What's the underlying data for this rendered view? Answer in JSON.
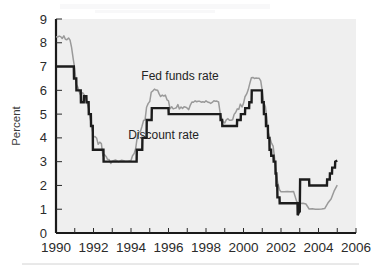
{
  "figure": {
    "background_color": "#ffffff",
    "plot_background_color": "#efefef",
    "axis_color": "#1a1a1a"
  },
  "axes": {
    "ylabel": "Percent",
    "ytick_labels": [
      "0",
      "1",
      "2",
      "3",
      "4",
      "5",
      "6",
      "7",
      "8",
      "9"
    ],
    "xtick_labels": [
      "1990",
      "1992",
      "1994",
      "1996",
      "1998",
      "2000",
      "2002",
      "2004",
      "2006"
    ]
  },
  "annotations": [
    {
      "name": "fed-funds-rate-label",
      "text": "Fed funds rate",
      "x": 1994.55,
      "y": 6.45
    },
    {
      "name": "discount-rate-label",
      "text": "Discount rate",
      "x": 1993.85,
      "y": 3.95
    }
  ],
  "chart_data": {
    "type": "line",
    "title": "",
    "subtitle": "",
    "xlabel": "",
    "ylabel": "Percent",
    "xlim": [
      1990,
      2006
    ],
    "ylim": [
      0,
      9
    ],
    "grid": false,
    "legend": "inline-annotations",
    "xticks_major": [
      1990,
      1992,
      1994,
      1996,
      1998,
      2000,
      2002,
      2004,
      2006
    ],
    "xticks_minor": [
      1991,
      1993,
      1995,
      1997,
      1999,
      2001,
      2003,
      2005
    ],
    "yticks": [
      0,
      1,
      2,
      3,
      4,
      5,
      6,
      7,
      8,
      9
    ],
    "series": [
      {
        "name": "Fed funds rate",
        "color": "#9a9a9a",
        "linewidth": 1.5,
        "points": [
          [
            1990.0,
            8.25
          ],
          [
            1990.08,
            8.24
          ],
          [
            1990.17,
            8.28
          ],
          [
            1990.25,
            8.26
          ],
          [
            1990.33,
            8.18
          ],
          [
            1990.42,
            8.29
          ],
          [
            1990.5,
            8.15
          ],
          [
            1990.58,
            8.13
          ],
          [
            1990.67,
            8.2
          ],
          [
            1990.75,
            8.11
          ],
          [
            1990.83,
            7.81
          ],
          [
            1990.92,
            7.31
          ],
          [
            1991.0,
            6.91
          ],
          [
            1991.08,
            6.25
          ],
          [
            1991.17,
            6.12
          ],
          [
            1991.25,
            5.91
          ],
          [
            1991.33,
            5.78
          ],
          [
            1991.42,
            5.9
          ],
          [
            1991.5,
            5.82
          ],
          [
            1991.58,
            5.66
          ],
          [
            1991.67,
            5.45
          ],
          [
            1991.75,
            5.21
          ],
          [
            1991.83,
            4.81
          ],
          [
            1991.92,
            4.43
          ],
          [
            1992.0,
            4.03
          ],
          [
            1992.08,
            4.06
          ],
          [
            1992.17,
            3.98
          ],
          [
            1992.25,
            3.73
          ],
          [
            1992.33,
            3.82
          ],
          [
            1992.42,
            3.76
          ],
          [
            1992.5,
            3.25
          ],
          [
            1992.58,
            3.3
          ],
          [
            1992.67,
            3.22
          ],
          [
            1992.75,
            3.1
          ],
          [
            1992.83,
            3.09
          ],
          [
            1992.92,
            2.92
          ],
          [
            1993.0,
            3.02
          ],
          [
            1993.17,
            3.07
          ],
          [
            1993.33,
            3.0
          ],
          [
            1993.5,
            3.06
          ],
          [
            1993.67,
            3.03
          ],
          [
            1993.83,
            3.02
          ],
          [
            1994.0,
            3.05
          ],
          [
            1994.08,
            3.25
          ],
          [
            1994.17,
            3.34
          ],
          [
            1994.25,
            3.56
          ],
          [
            1994.33,
            4.01
          ],
          [
            1994.42,
            4.25
          ],
          [
            1994.5,
            4.26
          ],
          [
            1994.58,
            4.47
          ],
          [
            1994.67,
            4.73
          ],
          [
            1994.75,
            4.76
          ],
          [
            1994.83,
            5.29
          ],
          [
            1994.92,
            5.45
          ],
          [
            1995.0,
            5.53
          ],
          [
            1995.08,
            5.92
          ],
          [
            1995.17,
            5.98
          ],
          [
            1995.25,
            6.05
          ],
          [
            1995.33,
            6.01
          ],
          [
            1995.42,
            6.0
          ],
          [
            1995.5,
            5.85
          ],
          [
            1995.58,
            5.74
          ],
          [
            1995.67,
            5.8
          ],
          [
            1995.75,
            5.76
          ],
          [
            1995.83,
            5.8
          ],
          [
            1995.92,
            5.6
          ],
          [
            1996.0,
            5.56
          ],
          [
            1996.08,
            5.22
          ],
          [
            1996.17,
            5.31
          ],
          [
            1996.25,
            5.22
          ],
          [
            1996.33,
            5.24
          ],
          [
            1996.42,
            5.27
          ],
          [
            1996.5,
            5.4
          ],
          [
            1996.58,
            5.22
          ],
          [
            1996.67,
            5.3
          ],
          [
            1996.75,
            5.24
          ],
          [
            1996.83,
            5.31
          ],
          [
            1996.92,
            5.29
          ],
          [
            1997.0,
            5.25
          ],
          [
            1997.08,
            5.19
          ],
          [
            1997.17,
            5.39
          ],
          [
            1997.25,
            5.51
          ],
          [
            1997.33,
            5.5
          ],
          [
            1997.42,
            5.56
          ],
          [
            1997.5,
            5.52
          ],
          [
            1997.58,
            5.54
          ],
          [
            1997.67,
            5.54
          ],
          [
            1997.75,
            5.5
          ],
          [
            1997.83,
            5.52
          ],
          [
            1997.92,
            5.5
          ],
          [
            1998.0,
            5.56
          ],
          [
            1998.08,
            5.51
          ],
          [
            1998.17,
            5.49
          ],
          [
            1998.25,
            5.45
          ],
          [
            1998.33,
            5.49
          ],
          [
            1998.42,
            5.56
          ],
          [
            1998.5,
            5.54
          ],
          [
            1998.58,
            5.55
          ],
          [
            1998.67,
            5.51
          ],
          [
            1998.75,
            5.07
          ],
          [
            1998.83,
            4.83
          ],
          [
            1998.92,
            4.68
          ],
          [
            1999.0,
            4.63
          ],
          [
            1999.08,
            4.76
          ],
          [
            1999.17,
            4.81
          ],
          [
            1999.25,
            4.74
          ],
          [
            1999.33,
            4.74
          ],
          [
            1999.42,
            4.76
          ],
          [
            1999.5,
            4.99
          ],
          [
            1999.58,
            5.07
          ],
          [
            1999.67,
            5.22
          ],
          [
            1999.75,
            5.2
          ],
          [
            1999.83,
            5.42
          ],
          [
            1999.92,
            5.3
          ],
          [
            2000.0,
            5.45
          ],
          [
            2000.08,
            5.73
          ],
          [
            2000.17,
            5.85
          ],
          [
            2000.25,
            6.02
          ],
          [
            2000.33,
            6.27
          ],
          [
            2000.42,
            6.53
          ],
          [
            2000.5,
            6.54
          ],
          [
            2000.58,
            6.5
          ],
          [
            2000.67,
            6.52
          ],
          [
            2000.75,
            6.51
          ],
          [
            2000.83,
            6.51
          ],
          [
            2000.92,
            6.4
          ],
          [
            2001.0,
            5.98
          ],
          [
            2001.08,
            5.49
          ],
          [
            2001.17,
            5.31
          ],
          [
            2001.25,
            4.8
          ],
          [
            2001.33,
            4.21
          ],
          [
            2001.42,
            3.97
          ],
          [
            2001.5,
            3.77
          ],
          [
            2001.58,
            3.65
          ],
          [
            2001.67,
            3.07
          ],
          [
            2001.75,
            2.49
          ],
          [
            2001.83,
            2.09
          ],
          [
            2001.92,
            1.82
          ],
          [
            2002.0,
            1.73
          ],
          [
            2002.17,
            1.74
          ],
          [
            2002.33,
            1.75
          ],
          [
            2002.5,
            1.73
          ],
          [
            2002.67,
            1.75
          ],
          [
            2002.83,
            1.34
          ],
          [
            2002.92,
            1.24
          ],
          [
            2003.0,
            1.24
          ],
          [
            2003.17,
            1.25
          ],
          [
            2003.33,
            1.22
          ],
          [
            2003.5,
            1.01
          ],
          [
            2003.67,
            1.02
          ],
          [
            2003.83,
            1.0
          ],
          [
            2004.0,
            1.0
          ],
          [
            2004.17,
            1.01
          ],
          [
            2004.33,
            1.03
          ],
          [
            2004.5,
            1.26
          ],
          [
            2004.67,
            1.43
          ],
          [
            2004.83,
            1.76
          ],
          [
            2005.0,
            2.01
          ]
        ]
      },
      {
        "name": "Discount rate",
        "color": "#1c1c1c",
        "linewidth": 2.4,
        "points": [
          [
            1990.0,
            7.0
          ],
          [
            1990.95,
            7.0
          ],
          [
            1990.96,
            6.5
          ],
          [
            1991.08,
            6.5
          ],
          [
            1991.09,
            6.0
          ],
          [
            1991.32,
            6.0
          ],
          [
            1991.33,
            5.5
          ],
          [
            1991.48,
            5.5
          ],
          [
            1991.49,
            5.75
          ],
          [
            1991.62,
            5.75
          ],
          [
            1991.63,
            5.5
          ],
          [
            1991.74,
            5.5
          ],
          [
            1991.75,
            5.0
          ],
          [
            1991.86,
            5.0
          ],
          [
            1991.87,
            4.5
          ],
          [
            1991.96,
            4.5
          ],
          [
            1991.97,
            3.5
          ],
          [
            1992.53,
            3.5
          ],
          [
            1992.54,
            3.0
          ],
          [
            1994.3,
            3.0
          ],
          [
            1994.31,
            3.5
          ],
          [
            1994.6,
            3.5
          ],
          [
            1994.61,
            4.0
          ],
          [
            1994.83,
            4.0
          ],
          [
            1994.84,
            4.75
          ],
          [
            1995.1,
            4.75
          ],
          [
            1995.11,
            5.25
          ],
          [
            1996.0,
            5.25
          ],
          [
            1996.01,
            5.0
          ],
          [
            1998.77,
            5.0
          ],
          [
            1998.78,
            4.75
          ],
          [
            1998.86,
            4.75
          ],
          [
            1998.87,
            4.5
          ],
          [
            1999.65,
            4.5
          ],
          [
            1999.66,
            4.75
          ],
          [
            1999.85,
            4.75
          ],
          [
            1999.86,
            5.0
          ],
          [
            2000.08,
            5.0
          ],
          [
            2000.09,
            5.25
          ],
          [
            2000.3,
            5.25
          ],
          [
            2000.31,
            5.5
          ],
          [
            2000.43,
            5.5
          ],
          [
            2000.44,
            6.0
          ],
          [
            2000.98,
            6.0
          ],
          [
            2000.99,
            5.5
          ],
          [
            2001.08,
            5.5
          ],
          [
            2001.09,
            5.0
          ],
          [
            2001.19,
            5.0
          ],
          [
            2001.2,
            4.5
          ],
          [
            2001.3,
            4.5
          ],
          [
            2001.31,
            4.0
          ],
          [
            2001.38,
            4.0
          ],
          [
            2001.39,
            3.5
          ],
          [
            2001.47,
            3.5
          ],
          [
            2001.48,
            3.25
          ],
          [
            2001.6,
            3.25
          ],
          [
            2001.61,
            3.0
          ],
          [
            2001.7,
            3.0
          ],
          [
            2001.71,
            2.5
          ],
          [
            2001.75,
            2.5
          ],
          [
            2001.76,
            2.0
          ],
          [
            2001.8,
            2.0
          ],
          [
            2001.81,
            1.5
          ],
          [
            2001.92,
            1.5
          ],
          [
            2001.93,
            1.25
          ],
          [
            2002.88,
            1.25
          ],
          [
            2002.89,
            0.75
          ],
          [
            2002.96,
            0.88
          ],
          [
            2003.0,
            0.9
          ],
          [
            2003.02,
            2.25
          ],
          [
            2003.5,
            2.25
          ],
          [
            2003.51,
            2.0
          ],
          [
            2004.45,
            2.0
          ],
          [
            2004.46,
            2.25
          ],
          [
            2004.6,
            2.25
          ],
          [
            2004.61,
            2.5
          ],
          [
            2004.72,
            2.5
          ],
          [
            2004.73,
            2.75
          ],
          [
            2004.88,
            2.75
          ],
          [
            2004.89,
            3.0
          ],
          [
            2005.0,
            3.05
          ]
        ]
      }
    ]
  }
}
